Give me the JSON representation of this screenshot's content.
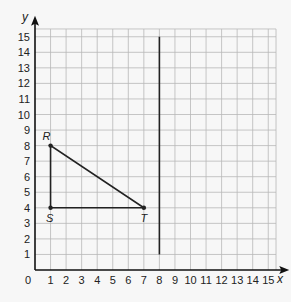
{
  "figure": {
    "x_axis_label": "x",
    "y_axis_label": "y",
    "origin_label": "0",
    "x_ticks": [
      "1",
      "2",
      "3",
      "4",
      "5",
      "6",
      "7",
      "8",
      "9",
      "10",
      "11",
      "12",
      "13",
      "14",
      "15"
    ],
    "y_ticks": [
      "1",
      "2",
      "3",
      "4",
      "5",
      "6",
      "7",
      "8",
      "9",
      "10",
      "11",
      "12",
      "13",
      "14",
      "15"
    ],
    "grid": {
      "min": 0,
      "max": 15,
      "extends_to": 15.5
    },
    "triangle": {
      "vertices": [
        {
          "label": "R",
          "x": 1,
          "y": 8
        },
        {
          "label": "S",
          "x": 1,
          "y": 4
        },
        {
          "label": "T",
          "x": 7,
          "y": 4
        }
      ]
    },
    "vertical_line": {
      "x": 8,
      "y_start": 1,
      "y_end": 15
    },
    "colors": {
      "grid": "#b8b8b8",
      "axis": "#111111",
      "shape": "#222222",
      "background": "#f7f7f7"
    }
  }
}
